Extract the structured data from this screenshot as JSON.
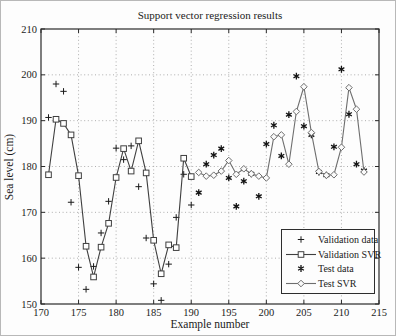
{
  "chart_data": {
    "type": "line",
    "title": "Support vector regression results",
    "xlabel": "Example number",
    "ylabel": "Sea level (cm)",
    "xlim": [
      170,
      215
    ],
    "ylim": [
      150,
      210
    ],
    "x_ticks": [
      170,
      175,
      180,
      185,
      190,
      195,
      200,
      205,
      210,
      215
    ],
    "y_ticks": [
      150,
      160,
      170,
      180,
      190,
      200,
      210
    ],
    "grid": "dotted",
    "legend_position": "lower-right",
    "colors": {
      "axis": "#2a2a2a",
      "grid": "#9a9a9a",
      "text": "#1b1b1b",
      "background": "#fdfdfd"
    },
    "series": [
      {
        "id": "validation-data",
        "name": "Validation data",
        "marker": "plus",
        "line": false,
        "color": "#1a1a1a",
        "x": [
          171,
          172,
          173,
          174,
          175,
          176,
          177,
          178,
          179,
          180,
          181,
          182,
          183,
          184,
          185,
          186,
          187,
          188,
          189,
          190
        ],
        "values": [
          190.7,
          198.0,
          196.4,
          172.2,
          158.0,
          153.2,
          158.2,
          165.5,
          172.4,
          184.0,
          181.5,
          184.5,
          175.6,
          164.4,
          154.4,
          150.8,
          158.7,
          168.9,
          178.3,
          171.6
        ]
      },
      {
        "id": "validation-svr",
        "name": "Validation SVR",
        "marker": "square",
        "line": true,
        "color": "#3f3f3f",
        "x": [
          171,
          172,
          173,
          174,
          175,
          176,
          177,
          178,
          179,
          180,
          181,
          182,
          183,
          184,
          185,
          186,
          187,
          188,
          189,
          190
        ],
        "values": [
          178.2,
          190.3,
          189.4,
          186.9,
          178.0,
          162.6,
          155.9,
          162.4,
          167.6,
          177.6,
          183.9,
          179.0,
          185.6,
          178.6,
          163.9,
          156.6,
          162.9,
          162.3,
          181.8,
          177.8
        ]
      },
      {
        "id": "test-data",
        "name": "Test data",
        "marker": "asterisk",
        "line": false,
        "color": "#141414",
        "x": [
          191,
          192,
          193,
          194,
          195,
          196,
          197,
          198,
          199,
          200,
          201,
          202,
          203,
          204,
          205,
          206,
          207,
          208,
          209,
          210,
          211,
          212,
          213
        ],
        "values": [
          174.3,
          180.5,
          182.5,
          183.9,
          177.5,
          171.3,
          176.8,
          178.4,
          173.5,
          184.9,
          189.0,
          182.3,
          191.3,
          199.7,
          188.8,
          186.9,
          178.8,
          178.1,
          184.3,
          201.2,
          191.4,
          180.5,
          179.1
        ]
      },
      {
        "id": "test-svr",
        "name": "Test SVR",
        "marker": "diamond",
        "line": true,
        "color": "#6e6e6e",
        "x": [
          191,
          192,
          193,
          194,
          195,
          196,
          197,
          198,
          199,
          200,
          201,
          202,
          203,
          204,
          205,
          206,
          207,
          208,
          209,
          210,
          211,
          212,
          213
        ],
        "values": [
          178.7,
          177.9,
          178.1,
          179.0,
          181.3,
          178.3,
          179.5,
          178.4,
          177.9,
          177.5,
          186.5,
          186.9,
          180.5,
          192.0,
          197.4,
          187.4,
          178.9,
          178.1,
          178.2,
          184.2,
          197.2,
          192.5,
          178.8
        ]
      }
    ]
  }
}
